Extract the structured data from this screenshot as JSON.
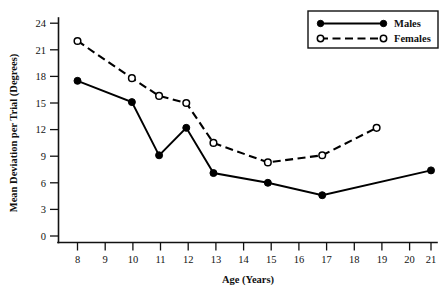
{
  "chart_data": {
    "type": "line",
    "title": "",
    "xlabel": "Age (Years)",
    "ylabel": "Mean Deviation per Trial (Degrees)",
    "xlim": [
      7.4,
      21.6
    ],
    "ylim": [
      0,
      25.2
    ],
    "grid": false,
    "legend_position": "top-right",
    "x_ticks": [
      8,
      9,
      10,
      11,
      12,
      13,
      14,
      15,
      16,
      17,
      18,
      19,
      20,
      21
    ],
    "x_tick_labels": [
      "8",
      "9",
      "10",
      "11",
      "12",
      "13",
      "14",
      "15",
      "16",
      "17",
      "18",
      "19",
      "20",
      "21"
    ],
    "y_ticks": [
      0,
      3,
      6,
      9,
      12,
      15,
      18,
      21,
      24
    ],
    "y_tick_labels": [
      "0",
      "3",
      "6",
      "9",
      "12",
      "15",
      "18",
      "21",
      "24"
    ],
    "series": [
      {
        "name": "Males",
        "marker": "filled-circle",
        "line_style": "solid",
        "color": "#000000",
        "x": [
          8,
          10,
          11,
          12,
          13,
          15,
          17,
          21
        ],
        "values": [
          17.5,
          15.1,
          9.1,
          12.2,
          7.1,
          6.0,
          4.6,
          7.4
        ]
      },
      {
        "name": "Females",
        "marker": "open-circle",
        "line_style": "dashed",
        "color": "#000000",
        "x": [
          8,
          10,
          11,
          12,
          13,
          15,
          17,
          19
        ],
        "values": [
          22.0,
          17.8,
          15.8,
          15.0,
          10.5,
          8.3,
          9.1,
          12.2
        ]
      }
    ]
  },
  "legend": {
    "entries": [
      {
        "label": "Males",
        "marker": "filled-circle",
        "line_style": "solid"
      },
      {
        "label": "Females",
        "marker": "open-circle",
        "line_style": "dashed"
      }
    ]
  },
  "axis": {
    "x_title": "Age (Years)",
    "y_title": "Mean Deviation per Trial (Degrees)"
  }
}
